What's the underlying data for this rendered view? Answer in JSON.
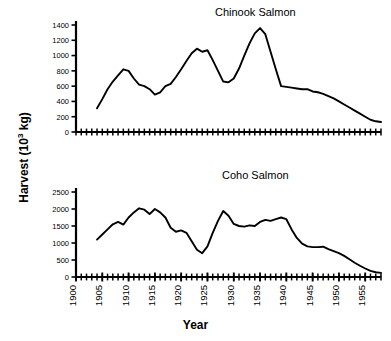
{
  "figure": {
    "xlabel": "Year",
    "ylabel_main": "Harvest (10",
    "ylabel_sup": "3",
    "ylabel_tail": " kg)",
    "ylabel_full": "Harvest (10^3 kg)",
    "background_color": "#ffffff",
    "line_color": "#000000",
    "axis_color": "#000000"
  },
  "chart_data": [
    {
      "type": "line",
      "title": "Chinook Salmon",
      "xlabel": "Year",
      "ylabel": "Harvest (10^3 kg)",
      "xlim": [
        1900,
        1958
      ],
      "ylim": [
        0,
        1400
      ],
      "ytick_values": [
        0,
        200,
        400,
        600,
        800,
        1000,
        1200,
        1400
      ],
      "ytick_labels": [
        "0",
        "200",
        "400",
        "600",
        "800",
        "1000",
        "1200",
        "1400"
      ],
      "xtick_values": [
        1900,
        1905,
        1910,
        1915,
        1920,
        1925,
        1930,
        1935,
        1940,
        1945,
        1950,
        1955
      ],
      "xtick_labels": [
        "1900",
        "1905",
        "1910",
        "1915",
        "1920",
        "1925",
        "1930",
        "1935",
        "1940",
        "1945",
        "1950",
        "1955"
      ],
      "xminor_step": 1,
      "grid": false,
      "legend": false,
      "series": [
        {
          "name": "Chinook harvest",
          "x": [
            1904,
            1905,
            1906,
            1907,
            1908,
            1909,
            1910,
            1911,
            1912,
            1913,
            1914,
            1915,
            1916,
            1917,
            1918,
            1919,
            1920,
            1921,
            1922,
            1923,
            1924,
            1925,
            1926,
            1927,
            1928,
            1929,
            1930,
            1931,
            1932,
            1933,
            1934,
            1935,
            1936,
            1937,
            1938,
            1939,
            1940,
            1941,
            1942,
            1943,
            1944,
            1945,
            1946,
            1947,
            1948,
            1949,
            1950,
            1951,
            1952,
            1953,
            1954,
            1955,
            1956,
            1957,
            1958
          ],
          "values": [
            310,
            430,
            560,
            660,
            740,
            820,
            800,
            700,
            620,
            600,
            560,
            490,
            520,
            600,
            630,
            720,
            820,
            930,
            1030,
            1090,
            1050,
            1070,
            940,
            800,
            660,
            650,
            700,
            830,
            1000,
            1160,
            1290,
            1360,
            1280,
            1050,
            820,
            600,
            590,
            580,
            570,
            560,
            560,
            530,
            520,
            500,
            470,
            440,
            400,
            360,
            320,
            280,
            240,
            200,
            160,
            140,
            130
          ]
        }
      ]
    },
    {
      "type": "line",
      "title": "Coho Salmon",
      "xlabel": "Year",
      "ylabel": "Harvest (10^3 kg)",
      "xlim": [
        1900,
        1958
      ],
      "ylim": [
        0,
        2500
      ],
      "ytick_values": [
        0,
        500,
        1000,
        1500,
        2000,
        2500
      ],
      "ytick_labels": [
        "0",
        "500",
        "1000",
        "1500",
        "2000",
        "2500"
      ],
      "xtick_values": [
        1900,
        1905,
        1910,
        1915,
        1920,
        1925,
        1930,
        1935,
        1940,
        1945,
        1950,
        1955
      ],
      "xtick_labels": [
        "1900",
        "1905",
        "1910",
        "1915",
        "1920",
        "1925",
        "1930",
        "1935",
        "1940",
        "1945",
        "1950",
        "1955"
      ],
      "xminor_step": 1,
      "grid": false,
      "legend": false,
      "series": [
        {
          "name": "Coho harvest",
          "x": [
            1904,
            1905,
            1906,
            1907,
            1908,
            1909,
            1910,
            1911,
            1912,
            1913,
            1914,
            1915,
            1916,
            1917,
            1918,
            1919,
            1920,
            1921,
            1922,
            1923,
            1924,
            1925,
            1926,
            1927,
            1928,
            1929,
            1930,
            1931,
            1932,
            1933,
            1934,
            1935,
            1936,
            1937,
            1938,
            1939,
            1940,
            1941,
            1942,
            1943,
            1944,
            1945,
            1946,
            1947,
            1948,
            1949,
            1950,
            1951,
            1952,
            1953,
            1954,
            1955,
            1956,
            1957,
            1958
          ],
          "values": [
            1100,
            1250,
            1400,
            1550,
            1620,
            1540,
            1750,
            1900,
            2020,
            1980,
            1850,
            2000,
            1900,
            1750,
            1450,
            1330,
            1370,
            1300,
            1050,
            800,
            700,
            900,
            1300,
            1650,
            1940,
            1800,
            1560,
            1500,
            1480,
            1520,
            1500,
            1620,
            1680,
            1650,
            1700,
            1750,
            1700,
            1400,
            1150,
            980,
            900,
            880,
            880,
            890,
            820,
            760,
            700,
            620,
            520,
            420,
            330,
            250,
            180,
            140,
            120
          ]
        }
      ]
    }
  ]
}
